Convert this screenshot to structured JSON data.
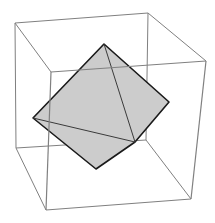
{
  "figure": {
    "type": "3d-polyhedron-plot",
    "shape": "tetrahedron",
    "background": "#ffffff",
    "face_color": "#cccccc",
    "edge_color": "#1a1a1a",
    "box_color": "#808080"
  },
  "box": {
    "back": {
      "tl": [
        15,
        23
      ],
      "tr": [
        148,
        13
      ],
      "bl": [
        16,
        148
      ],
      "br": [
        146,
        140
      ]
    },
    "front": {
      "tl": [
        51,
        72
      ],
      "tr": [
        206,
        61
      ],
      "bl": [
        46,
        210
      ],
      "br": [
        191,
        199
      ]
    }
  },
  "tetrahedron": {
    "vertices": {
      "top": [
        104,
        44
      ],
      "left": [
        33,
        118
      ],
      "bottom": [
        96,
        169
      ],
      "inner": [
        135,
        142
      ],
      "right": [
        169,
        102
      ]
    },
    "outline": [
      "top",
      "right",
      "inner",
      "bottom",
      "left"
    ],
    "inner_edges": [
      [
        "top",
        "inner"
      ],
      [
        "left",
        "inner"
      ]
    ]
  }
}
